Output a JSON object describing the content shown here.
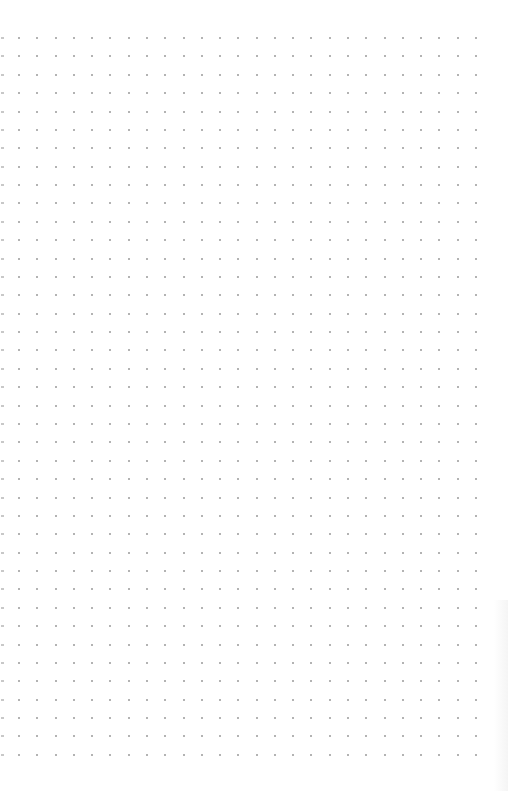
{
  "page": {
    "type": "dot-grid-paper",
    "background_color": "#ffffff",
    "dot_color": "#9a9a9a",
    "edge_mark_color": "#c8c8c8"
  },
  "grid": {
    "columns": 26,
    "rows": 40,
    "origin_x": 19,
    "origin_y": 38,
    "spacing_x": 18.28,
    "spacing_y": 18.38
  }
}
